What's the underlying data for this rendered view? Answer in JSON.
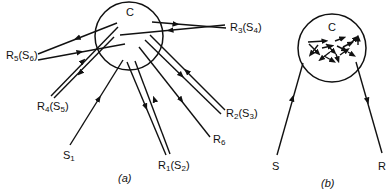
{
  "figure": {
    "panel_a": {
      "caption": "(a)",
      "circle_label": "C",
      "labels": {
        "R5": {
          "main": "R",
          "sub": "5",
          "paren_main": "S",
          "paren_sub": "6"
        },
        "R3": {
          "main": "R",
          "sub": "3",
          "paren_main": "S",
          "paren_sub": "4"
        },
        "R4": {
          "main": "R",
          "sub": "4",
          "paren_main": "S",
          "paren_sub": "5"
        },
        "R2": {
          "main": "R",
          "sub": "2",
          "paren_main": "S",
          "paren_sub": "3"
        },
        "R6": {
          "main": "R",
          "sub": "6"
        },
        "S1": {
          "main": "S",
          "sub": "1"
        },
        "R1": {
          "main": "R",
          "sub": "1",
          "paren_main": "S",
          "paren_sub": "2"
        }
      }
    },
    "panel_b": {
      "caption": "(b)",
      "circle_label": "C",
      "source_label": "S",
      "receiver_label": "R"
    }
  }
}
